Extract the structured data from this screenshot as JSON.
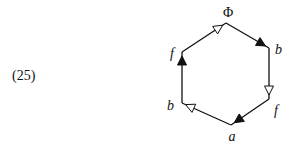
{
  "equation_number": "(25)",
  "diagram": {
    "type": "hexagon-cycle",
    "vertices": [
      {
        "id": "top",
        "label": "Φ"
      },
      {
        "id": "upper-right",
        "label": "b"
      },
      {
        "id": "lower-right",
        "label": "f"
      },
      {
        "id": "bottom",
        "label": "a"
      },
      {
        "id": "lower-left",
        "label": "b"
      },
      {
        "id": "upper-left",
        "label": "f"
      }
    ],
    "edges": [
      {
        "from": "upper-left",
        "to": "top",
        "arrow": "open"
      },
      {
        "from": "top",
        "to": "upper-right",
        "arrow": "filled"
      },
      {
        "from": "upper-right",
        "to": "lower-right",
        "arrow": "open"
      },
      {
        "from": "lower-right",
        "to": "bottom",
        "arrow": "filled"
      },
      {
        "from": "bottom",
        "to": "lower-left",
        "arrow": "open"
      },
      {
        "from": "lower-left",
        "to": "upper-left",
        "arrow": "filled"
      }
    ],
    "stroke_color": "#111111"
  }
}
